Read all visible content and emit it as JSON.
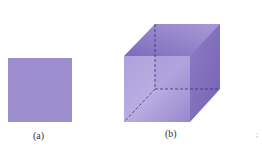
{
  "figures": [
    {
      "id": "a",
      "caption": "(a)",
      "shape": "square"
    },
    {
      "id": "b",
      "caption": "(b)",
      "shape": "cube"
    }
  ],
  "colors": {
    "face_light": "#a99ad6",
    "face_mid": "#9483cc",
    "face_dark": "#7d6bbb",
    "edge_dashed": "#3d2f73"
  },
  "stray_mark": ";"
}
